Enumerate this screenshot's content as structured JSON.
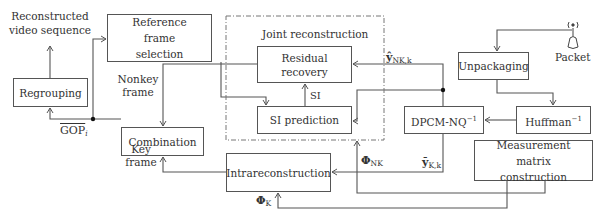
{
  "diagram": {
    "title_region": "Joint reconstruction",
    "blocks": {
      "regrouping": "Regrouping",
      "reference_frame_selection": "Reference frame selection",
      "residual_recovery": "Residual recovery",
      "si_prediction": "SI prediction",
      "combination": "Combination",
      "unpackaging": "Unpackaging",
      "dpcm_nq_inv": "DPCM-NQ",
      "dpcm_nq_inv_sup": "−1",
      "huffman_inv": "Huffman",
      "huffman_inv_sup": "−1",
      "measurement_matrix": "Measurement matrix construction",
      "intrareconstruction": "Intrareconstruction"
    },
    "labels": {
      "output": "Reconstructed video sequence",
      "nonkey_frame": "Nonkey frame",
      "key_frame": "Key frame",
      "gop": "GOP",
      "gop_sub": "i",
      "si": "SI",
      "packet": "Packet",
      "y_nk": "ŷ",
      "y_nk_sub": "NK,k",
      "y_k": "ȳ",
      "y_k_sub": "K,k",
      "phi": "Φ",
      "phi_nk_sub": "NK",
      "phi_k_sub": "K"
    },
    "edges": [
      {
        "from": "Regrouping",
        "to": "Reconstructed video sequence"
      },
      {
        "from": "GOP junction",
        "to": "Regrouping"
      },
      {
        "from": "GOP junction",
        "to": "Reference frame selection"
      },
      {
        "from": "Reference frame selection",
        "to": "SI prediction"
      },
      {
        "from": "Residual recovery",
        "to": "Combination",
        "label": "Nonkey frame"
      },
      {
        "from": "SI prediction",
        "to": "Residual recovery",
        "label": "SI"
      },
      {
        "from": "DPCM-NQ^-1",
        "to": "Residual recovery",
        "label": "ŷ_NK,k"
      },
      {
        "from": "DPCM-NQ^-1",
        "to": "SI prediction"
      },
      {
        "from": "Packet",
        "to": "Unpackaging"
      },
      {
        "from": "Unpackaging",
        "to": "Huffman^-1"
      },
      {
        "from": "Huffman^-1",
        "to": "DPCM-NQ^-1"
      },
      {
        "from": "DPCM-NQ^-1",
        "to": "Intrareconstruction",
        "label": "ȳ_K,k"
      },
      {
        "from": "Measurement matrix construction",
        "to": "Joint reconstruction",
        "label": "Φ_NK"
      },
      {
        "from": "Measurement matrix construction",
        "to": "Intrareconstruction",
        "label": "Φ_K"
      },
      {
        "from": "Intrareconstruction",
        "to": "Combination",
        "label": "Key frame"
      },
      {
        "from": "Combination",
        "to": "GOP junction",
        "label": "GOP_i"
      }
    ]
  }
}
